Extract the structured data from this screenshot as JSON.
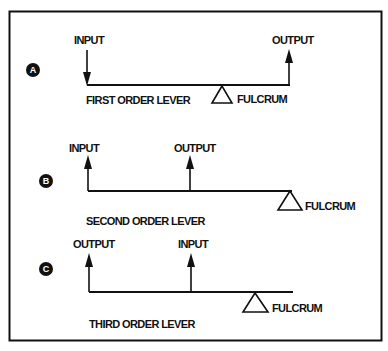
{
  "colors": {
    "ink": "#111111",
    "background": "#ffffff"
  },
  "panels": [
    {
      "badge": "A",
      "title": "FIRST ORDER LEVER",
      "labels": {
        "left": "INPUT",
        "right": "OUTPUT",
        "fulcrum": "FULCRUM"
      },
      "arrangement": "fulcrum between input and output",
      "input_direction": "down",
      "output_direction": "up"
    },
    {
      "badge": "B",
      "title": "SECOND ORDER LEVER",
      "labels": {
        "left": "INPUT",
        "middle": "OUTPUT",
        "fulcrum": "FULCRUM"
      },
      "arrangement": "output between input and fulcrum",
      "input_direction": "up",
      "output_direction": "up"
    },
    {
      "badge": "C",
      "title": "THIRD ORDER LEVER",
      "labels": {
        "left": "OUTPUT",
        "middle": "INPUT",
        "fulcrum": "FULCRUM"
      },
      "arrangement": "input between output and fulcrum",
      "input_direction": "up",
      "output_direction": "up"
    }
  ]
}
